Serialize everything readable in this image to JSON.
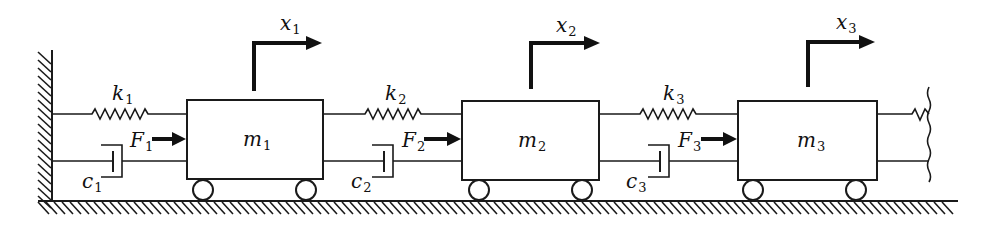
{
  "diagram": {
    "masses": [
      {
        "symbol": "m",
        "sub": "1",
        "x": 187,
        "y": 100,
        "w": 136,
        "h": 79
      },
      {
        "symbol": "m",
        "sub": "2",
        "x": 462,
        "y": 101,
        "w": 137,
        "h": 79
      },
      {
        "symbol": "m",
        "sub": "3",
        "x": 738,
        "y": 101,
        "w": 139,
        "h": 79
      }
    ],
    "springs": [
      {
        "symbol": "k",
        "sub": "1"
      },
      {
        "symbol": "k",
        "sub": "2"
      },
      {
        "symbol": "k",
        "sub": "3"
      }
    ],
    "dampers": [
      {
        "symbol": "c",
        "sub": "1"
      },
      {
        "symbol": "c",
        "sub": "2"
      },
      {
        "symbol": "c",
        "sub": "3"
      }
    ],
    "forces": [
      {
        "symbol": "F",
        "sub": "1"
      },
      {
        "symbol": "F",
        "sub": "2"
      },
      {
        "symbol": "F",
        "sub": "3"
      }
    ],
    "displacements": [
      {
        "symbol": "x",
        "sub": "1"
      },
      {
        "symbol": "x",
        "sub": "2"
      },
      {
        "symbol": "x",
        "sub": "3"
      }
    ],
    "colors": {
      "ink": "#1a1a1a",
      "background": "#ffffff"
    }
  }
}
